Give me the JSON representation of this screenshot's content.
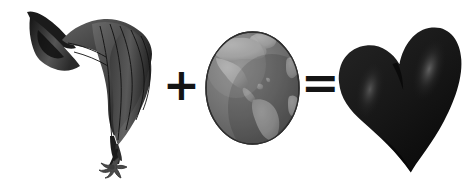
{
  "image": {
    "title": "Cloth plus Globe equals Heart",
    "width": 470,
    "height": 182,
    "background_color": "#ffffff",
    "composition": "pictorial equation: subject + globe = heart"
  },
  "equation": {
    "operator_plus": "+",
    "operator_equals": "=",
    "plus_label": "plus",
    "equals_label": "equals"
  },
  "terms": [
    {
      "id": "cloth",
      "name": "draped-cloth",
      "label": "Draped hanging cloth with claw",
      "alt_text": "Dark flowing draped fabric narrowing to a thin stem with a small claw at the bottom",
      "colors": {
        "fill_dark": "#2b2b2b",
        "fill_mid": "#4a4a4a",
        "fill_light": "#6f6f6f",
        "outline": "#111111"
      },
      "bounds": {
        "x": 20,
        "y": 8,
        "width": 135,
        "height": 168
      }
    },
    {
      "id": "globe",
      "name": "earth-globe",
      "label": "Earth globe (Americas)",
      "alt_text": "Grayscale globe of Earth showing North and South America",
      "colors": {
        "ocean": "#6d6d6d",
        "land": "#9a9a9a",
        "shadow": "#4f4f4f",
        "highlight": "#b0b0b0",
        "outline": "#2e2e2e"
      },
      "bounds": {
        "x": 206,
        "y": 32,
        "width": 93,
        "height": 112
      },
      "continents_visible": [
        "North America",
        "South America",
        "Greenland",
        "Africa (edge)"
      ]
    },
    {
      "id": "heart",
      "name": "heart-shape",
      "label": "Glossy dark heart",
      "alt_text": "Large near-black heart tilted slightly, with soft glossy highlights on both lobes",
      "colors": {
        "fill": "#1a1a1a",
        "highlight": "#4d4d4d",
        "shadow": "#080808"
      },
      "bounds": {
        "x": 341,
        "y": 22,
        "width": 124,
        "height": 155
      }
    }
  ]
}
